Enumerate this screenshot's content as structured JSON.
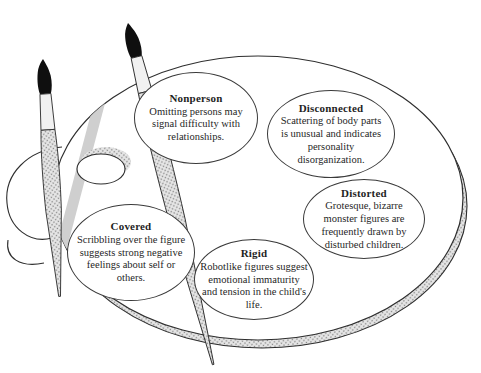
{
  "figure": {
    "type": "concept-diagram",
    "illustration": {
      "palette_icon": "artist-palette",
      "brush_icons": [
        "paintbrush",
        "paintbrush"
      ],
      "colors": {
        "ink": "#2e2e2e",
        "bristle": "#0f0f0f",
        "ferrule": "#f1f1f1",
        "texture_dot": "#8a8a8a",
        "texture_bg": "#e6e6e6",
        "shadow": "#c9c9c9",
        "paper": "#ffffff"
      }
    },
    "nodes": [
      {
        "id": "nonperson",
        "label": "Nonperson",
        "description": "Omitting persons may signal difficulty with relationships."
      },
      {
        "id": "disconnected",
        "label": "Disconnected",
        "description": "Scattering of body parts is unusual and indicates personality disorganization."
      },
      {
        "id": "distorted",
        "label": "Distorted",
        "description": "Grotesque, bizarre monster figures are frequently drawn by disturbed children."
      },
      {
        "id": "covered",
        "label": "Covered",
        "description": "Scribbling over the figure suggests strong negative feelings about self or others."
      },
      {
        "id": "rigid",
        "label": "Rigid",
        "description": "Robotlike figures suggest emotional immaturity and tension in the child's life."
      }
    ]
  }
}
